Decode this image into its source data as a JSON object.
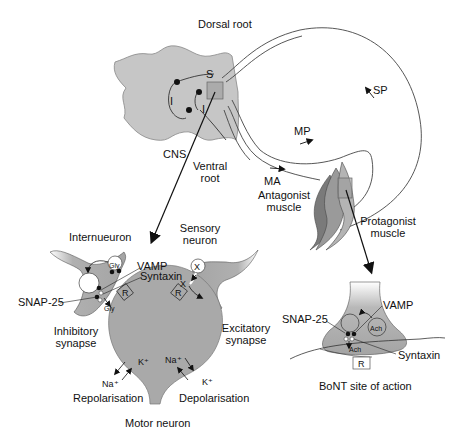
{
  "figure": {
    "cropped_header": "",
    "spinal_cord": {
      "labels": {
        "dorsal_root": "Dorsal root",
        "cns": "CNS",
        "ventral_root": "Ventral\nroot",
        "ventral_root_line1": "Ventral",
        "ventral_root_line2": "root",
        "s": "S",
        "i1": "I",
        "i2": "I"
      }
    },
    "pathways": {
      "sp": "SP",
      "mp": "MP",
      "ma": "MA"
    },
    "muscles": {
      "antagonist_line1": "Antagonist",
      "antagonist_line2": "muscle",
      "protagonist_line1": "Protagonist",
      "protagonist_line2": "muscle"
    },
    "synapse_detail": {
      "internueuron": "Internueuron",
      "sensory_line1": "Sensory",
      "sensory_line2": "neuron",
      "vamp": "VAMP",
      "syntaxin": "Syntaxin",
      "snap25": "SNAP-25",
      "gly_vesicle": "Gly",
      "gly_release": "Gly",
      "x_vesicle": "X",
      "x_release": "X",
      "receptor_left": "R",
      "receptor_right": "R",
      "inhibitory_line1": "Inhibitory",
      "inhibitory_line2": "synapse",
      "excitatory_line1": "Excitatory",
      "excitatory_line2": "synapse",
      "k_left": "K⁺",
      "na_left": "Na⁺",
      "na_right": "Na⁺",
      "k_right": "K⁺",
      "repolarisation": "Repolarisation",
      "depolarisation": "Depolarisation",
      "motor_neuron": "Motor neuron"
    },
    "nmj_detail": {
      "snap25": "SNAP-25",
      "vamp": "VAMP",
      "syntaxin": "Syntaxin",
      "ach_vesicle": "Ach",
      "ach_release": "Ach",
      "receptor": "R",
      "caption": "BoNT site of action"
    },
    "colors": {
      "tissue_fill": "#a9a9a9",
      "tissue_light": "#c8c8c8",
      "muscle_dark": "#7a7a7a",
      "line": "#222222",
      "background": "#ffffff"
    }
  }
}
